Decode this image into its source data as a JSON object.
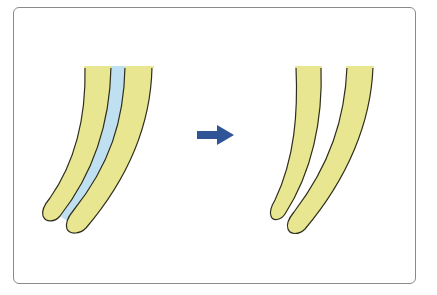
{
  "diagram": {
    "type": "before-after illustration",
    "colors": {
      "finger_fill": "#e8e690",
      "gap_fill": "#bfe0f0",
      "outline": "#2e2e1e",
      "arrow": "#2f5597",
      "frame_border": "#8a8a8a"
    },
    "panels": [
      {
        "name": "before",
        "description": "two curved yellow strips joined by a light-blue band"
      },
      {
        "name": "after",
        "description": "two separated curved yellow strips"
      }
    ],
    "arrow": {
      "direction": "right"
    }
  }
}
